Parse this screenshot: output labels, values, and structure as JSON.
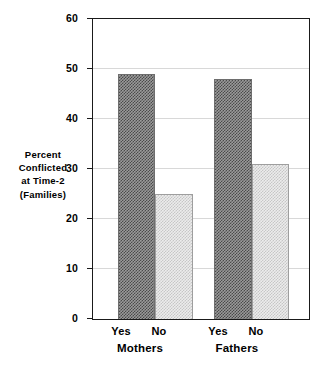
{
  "chart_data": {
    "type": "bar",
    "title": "",
    "xlabel": "",
    "ylabel": "Percent Conflicted at Time-2 (Families)",
    "ylabel_lines": [
      "Percent",
      "Conflicted",
      "at Time-2",
      "(Families)"
    ],
    "ylim": [
      0,
      60
    ],
    "yticks": [
      0,
      10,
      20,
      30,
      40,
      50,
      60
    ],
    "ytick_labels": [
      "0",
      "10",
      "20",
      "30",
      "40",
      "50",
      "60"
    ],
    "grid": true,
    "grid_axis": "y",
    "legend": "none",
    "groups": [
      "Mothers",
      "Fathers"
    ],
    "categories": [
      "Yes",
      "No"
    ],
    "bars": [
      {
        "group": "Mothers",
        "category": "Yes",
        "value": 49,
        "fill": "dark-checkered"
      },
      {
        "group": "Mothers",
        "category": "No",
        "value": 25,
        "fill": "light-dotted"
      },
      {
        "group": "Fathers",
        "category": "Yes",
        "value": 48,
        "fill": "dark-checkered"
      },
      {
        "group": "Fathers",
        "category": "No",
        "value": 31,
        "fill": "light-dotted"
      }
    ],
    "series": [
      {
        "name": "Yes",
        "values": [
          49,
          48
        ]
      },
      {
        "name": "No",
        "values": [
          25,
          31
        ]
      }
    ],
    "colors": {
      "bar_yes": "#4a4a4a",
      "bar_no": "#c6c6c6",
      "axis": "#1a1a1a",
      "gridline": "#d8d8d8",
      "background": "#ffffff"
    }
  }
}
